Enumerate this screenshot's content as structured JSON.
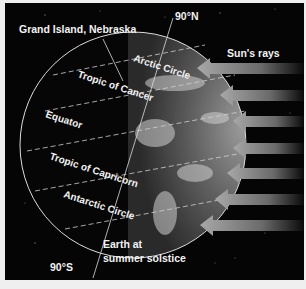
{
  "figure": {
    "title": "Earth at summer solstice",
    "caption_lines": [
      "Earth at",
      "summer solstice"
    ],
    "location_label": "Grand Island, Nebraska",
    "north_pole_label": "90°N",
    "south_pole_label": "90°S",
    "sun_label": "Sun's rays",
    "latitude_lines": [
      {
        "name": "Arctic Circle"
      },
      {
        "name": "Tropic of Cancer"
      },
      {
        "name": "Equator"
      },
      {
        "name": "Tropic of Capricorn"
      },
      {
        "name": "Antarctic Circle"
      }
    ],
    "arrow_count": 7,
    "colors": {
      "background": "#050505",
      "frame": "#efefef",
      "text": "#f2f2f2",
      "arrow": "#9a9a9a"
    }
  }
}
